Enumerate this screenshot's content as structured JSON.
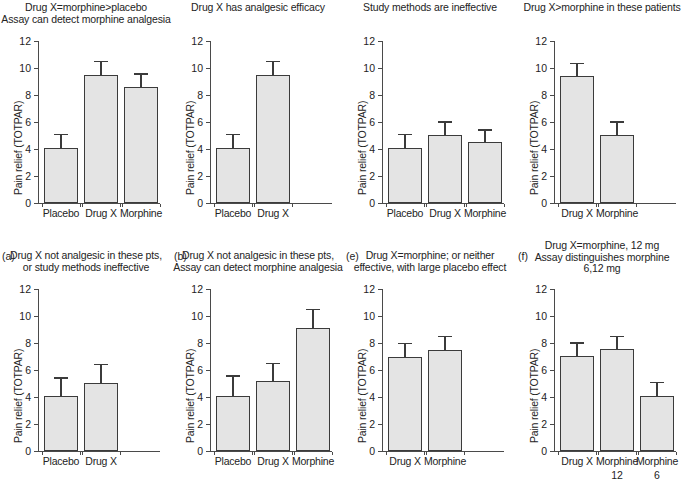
{
  "figure": {
    "shared": {
      "ylabel": "Pain relief (TOTPAR)",
      "yticks": [
        "0",
        "2",
        "4",
        "6",
        "8",
        "10",
        "12"
      ],
      "ylim_min": 0,
      "ylim_max": 12,
      "bar_fill": "#e4e4e4",
      "bar_edge": "#3b3b3b",
      "axis_color": "#4a4a4a"
    }
  },
  "chart_data": [
    {
      "type": "bar",
      "panel": "a",
      "letter": "(a)",
      "title": "Drug X=morphine>placebo\nAssay can detect morphine analgesia",
      "categories": [
        "Placebo",
        "Drug X",
        "Morphine"
      ],
      "values": [
        4.1,
        9.5,
        8.6
      ],
      "errors": [
        1.0,
        1.0,
        1.0
      ],
      "xlabel": "",
      "ylabel": "Pain relief (TOTPAR)",
      "ylim": [
        0,
        12
      ],
      "yticks": [
        0,
        2,
        4,
        6,
        8,
        10,
        12
      ],
      "grid": false,
      "legend": "none"
    },
    {
      "type": "bar",
      "panel": "b",
      "letter": "(b)",
      "title": "Drug X has analgesic efficacy",
      "categories": [
        "Placebo",
        "Drug X"
      ],
      "values": [
        4.1,
        9.5
      ],
      "errors": [
        1.0,
        1.0
      ],
      "xlabel": "",
      "ylabel": "Pain relief (TOTPAR)",
      "ylim": [
        0,
        12
      ],
      "yticks": [
        0,
        2,
        4,
        6,
        8,
        10,
        12
      ],
      "grid": false,
      "legend": "none"
    },
    {
      "type": "bar",
      "panel": "e",
      "letter": "(e)",
      "title": "Study methods are ineffective",
      "categories": [
        "Placebo",
        "Drug X",
        "Morphine"
      ],
      "values": [
        4.1,
        5.05,
        4.5
      ],
      "errors": [
        1.0,
        1.0,
        0.95
      ],
      "xlabel": "",
      "ylabel": "Pain relief (TOTPAR)",
      "ylim": [
        0,
        12
      ],
      "yticks": [
        0,
        2,
        4,
        6,
        8,
        10,
        12
      ],
      "grid": false,
      "legend": "none"
    },
    {
      "type": "bar",
      "panel": "f",
      "letter": "(f)",
      "title": "Drug X>morphine in these patients",
      "categories": [
        "Drug X",
        "Morphine"
      ],
      "values": [
        9.4,
        5.05
      ],
      "errors": [
        1.0,
        1.0
      ],
      "xlabel": "",
      "ylabel": "Pain relief (TOTPAR)",
      "ylim": [
        0,
        12
      ],
      "yticks": [
        0,
        2,
        4,
        6,
        8,
        10,
        12
      ],
      "grid": false,
      "legend": "none"
    },
    {
      "type": "bar",
      "panel": "c",
      "letter": "(c)",
      "title": "Drug X not analgesic in these pts,\nor study methods ineffective",
      "categories": [
        "Placebo",
        "Drug X"
      ],
      "values": [
        4.1,
        5.05
      ],
      "errors": [
        1.35,
        1.4
      ],
      "xlabel": "",
      "ylabel": "Pain relief (TOTPAR)",
      "ylim": [
        0,
        12
      ],
      "yticks": [
        0,
        2,
        4,
        6,
        8,
        10,
        12
      ],
      "grid": false,
      "legend": "none"
    },
    {
      "type": "bar",
      "panel": "d",
      "letter": "(d)",
      "title": "Drug X not analgesic in these pts,\nAssay can detect morphine analgesia",
      "categories": [
        "Placebo",
        "Drug X",
        "Morphine"
      ],
      "values": [
        4.1,
        5.15,
        9.1
      ],
      "errors": [
        1.5,
        1.35,
        1.45
      ],
      "xlabel": "",
      "ylabel": "Pain relief (TOTPAR)",
      "ylim": [
        0,
        12
      ],
      "yticks": [
        0,
        2,
        4,
        6,
        8,
        10,
        12
      ],
      "grid": false,
      "legend": "none"
    },
    {
      "type": "bar",
      "panel": "g",
      "letter": "(g)",
      "title": "Drug X=morphine; or neither\neffective, with large placebo effect",
      "categories": [
        "Drug X",
        "Morphine"
      ],
      "values": [
        6.95,
        7.5
      ],
      "errors": [
        1.05,
        1.05
      ],
      "xlabel": "",
      "ylabel": "Pain relief (TOTPAR)",
      "ylim": [
        0,
        12
      ],
      "yticks": [
        0,
        2,
        4,
        6,
        8,
        10,
        12
      ],
      "grid": false,
      "legend": "none"
    },
    {
      "type": "bar",
      "panel": "h",
      "letter": "(h)",
      "title": "Drug X=morphine, 12 mg\nAssay distinguishes morphine\n6,12 mg",
      "categories": [
        "Drug X",
        "Morphine",
        "Morphine"
      ],
      "category_sublabels": [
        "",
        "12",
        "6"
      ],
      "values": [
        7.05,
        7.55,
        4.1
      ],
      "errors": [
        1.0,
        1.0,
        1.0
      ],
      "xlabel": "",
      "ylabel": "Pain relief (TOTPAR)",
      "ylim": [
        0,
        12
      ],
      "yticks": [
        0,
        2,
        4,
        6,
        8,
        10,
        12
      ],
      "grid": false,
      "legend": "none"
    }
  ]
}
